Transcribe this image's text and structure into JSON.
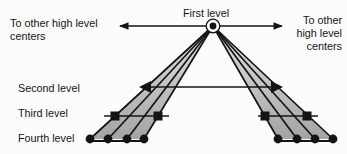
{
  "figure": {
    "type": "hierarchical-network-diagram",
    "levels": [
      {
        "label": "First level",
        "marker": "circled-dot-node",
        "count": 1
      },
      {
        "label": "Second level",
        "marker": "triangle-node",
        "count": 2
      },
      {
        "label": "Third level",
        "marker": "square-node",
        "count": 4
      },
      {
        "label": "Fourth level",
        "marker": "dot-node",
        "count": 8
      }
    ],
    "left_note": {
      "line1": "To other high level",
      "line2": "centers"
    },
    "right_note": {
      "line1": "To other",
      "line2": "high level",
      "line3": "centers"
    },
    "colors": {
      "ink": "#141414",
      "background": "#fcfcfc",
      "fan_fill_top": "#e4e4e4",
      "fan_fill_bottom": "#a2a2a2"
    }
  }
}
